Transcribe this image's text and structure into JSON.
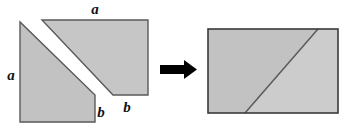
{
  "diagram": {
    "type": "geometric-dissection",
    "background_color": "#ffffff",
    "fill_gray": "#c2c2c2",
    "fill_gray_light": "#cccccc",
    "stroke_color": "#555555",
    "arrow_color": "#000000",
    "gap_color": "#ffffff"
  },
  "left_figure": {
    "name": "stepped-polygon-dissection",
    "pieces": [
      {
        "name": "lower-left-piece",
        "shape": "right-triangle-with-rectangle",
        "points": "20,22 20,122 95,122 95,95",
        "fill": "#c2c2c2"
      },
      {
        "name": "upper-right-piece",
        "shape": "trapezoid",
        "points": "42,20 148,20 148,95 113,95",
        "fill": "#c6c6c6"
      }
    ],
    "labels": [
      {
        "name": "label-a-top",
        "text": "a",
        "x": 95,
        "y": 14
      },
      {
        "name": "label-a-left",
        "text": "a",
        "x": 11,
        "y": 80
      },
      {
        "name": "label-b-lower",
        "text": "b",
        "x": 101,
        "y": 117
      },
      {
        "name": "label-b-right",
        "text": "b",
        "x": 127,
        "y": 112
      }
    ]
  },
  "arrow": {
    "name": "transformation-arrow",
    "direction": "right",
    "shaft": {
      "x": 160,
      "y": 65,
      "width": 24,
      "height": 9
    },
    "head": "184,60 197,69.5 184,79",
    "color": "#000000"
  },
  "right_figure": {
    "name": "assembled-rectangle",
    "outline": {
      "x": 208,
      "y": 29,
      "width": 130,
      "height": 84
    },
    "pieces": [
      {
        "name": "lower-left-triangle-piece",
        "points": "208,29 208,113 245,113 318,29",
        "fill": "#c2c2c2"
      },
      {
        "name": "upper-right-triangle-piece",
        "points": "318,29 338,29 338,113 245,113",
        "fill": "#cccccc"
      }
    ],
    "diagonal": {
      "x1": 245,
      "y1": 113,
      "x2": 318,
      "y2": 29
    }
  }
}
